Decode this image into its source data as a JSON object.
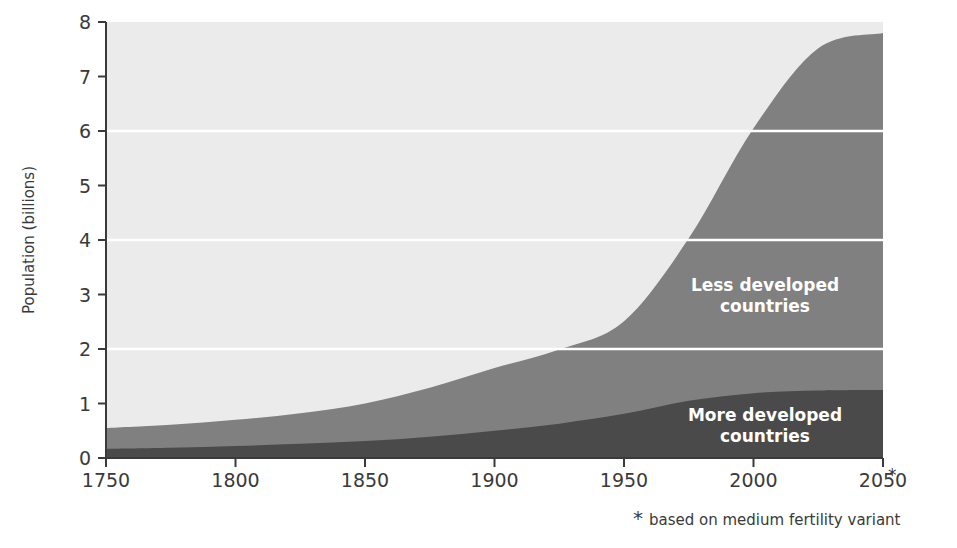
{
  "chart_data": {
    "type": "area",
    "stacked": true,
    "title": "",
    "xlabel": "",
    "ylabel": "Population (billions)",
    "xlim": [
      1750,
      2050
    ],
    "ylim": [
      0,
      8
    ],
    "xticks": [
      1750,
      1800,
      1850,
      1900,
      1950,
      2000,
      2050
    ],
    "xticklabels": [
      "1750",
      "1800",
      "1850",
      "1900",
      "1950",
      "2000",
      "2050"
    ],
    "yticks": [
      0,
      1,
      2,
      3,
      4,
      5,
      6,
      7,
      8
    ],
    "yticklabels": [
      "0",
      "1",
      "2",
      "3",
      "4",
      "5",
      "6",
      "7",
      "8"
    ],
    "grid": "horizontal-white-at-2-4-6",
    "gridline_values": [
      2,
      4,
      6
    ],
    "legend_position": "inline-annotations",
    "x": [
      1750,
      1775,
      1800,
      1825,
      1850,
      1875,
      1900,
      1925,
      1950,
      1975,
      2000,
      2025,
      2050
    ],
    "series": [
      {
        "name": "More developed countries",
        "color": "#4a4a4a",
        "values": [
          0.17,
          0.19,
          0.22,
          0.26,
          0.31,
          0.39,
          0.5,
          0.63,
          0.81,
          1.05,
          1.19,
          1.24,
          1.25
        ]
      },
      {
        "name": "Less developed countries",
        "color": "#808080",
        "values": [
          0.38,
          0.42,
          0.48,
          0.56,
          0.69,
          0.9,
          1.15,
          1.36,
          1.7,
          2.98,
          4.86,
          6.28,
          6.55
        ]
      }
    ],
    "totals": [
      0.55,
      0.61,
      0.7,
      0.82,
      1.0,
      1.29,
      1.65,
      1.99,
      2.51,
      4.03,
      6.05,
      7.52,
      7.8
    ],
    "annotations": [
      {
        "text": "Less developed countries",
        "x": 2010,
        "y": 3.25,
        "color": "#ffffff"
      },
      {
        "text": "More developed countries",
        "x": 2010,
        "y": 0.72,
        "color": "#ffffff"
      }
    ],
    "footnote": "based on medium fertility variant",
    "footnote_marker": "*",
    "plot_background": "#ebebeb"
  },
  "axis": {
    "ylabel": "Population (billions)"
  },
  "ticks": {
    "y": [
      "8",
      "7",
      "6",
      "5",
      "4",
      "3",
      "2",
      "1",
      "0"
    ],
    "x": [
      "1750",
      "1800",
      "1850",
      "1900",
      "1950",
      "2000",
      "2050"
    ],
    "x_last_marker": "*"
  },
  "labels": {
    "less_developed_line1": "Less developed",
    "less_developed_line2": "countries",
    "more_developed_line1": "More  developed",
    "more_developed_line2": "countries"
  },
  "footnote": {
    "marker": "*",
    "text": "based on medium fertility variant"
  },
  "colors": {
    "plot_background": "#ebebeb",
    "less_developed": "#808080",
    "more_developed": "#4a4a4a",
    "gridline": "#ffffff",
    "axis": "#3a3a3a",
    "text": "#3a3a3a"
  }
}
